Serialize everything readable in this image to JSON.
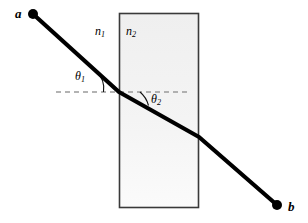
{
  "figure": {
    "background_color": "#ffffff",
    "canvas": {
      "width": 308,
      "height": 223
    }
  },
  "slab": {
    "name": "refracting-medium-slab",
    "x": 119,
    "y": 13,
    "width": 80,
    "height": 195,
    "border_color": "#3a3a3a",
    "fill_top_color": "#efefef",
    "fill_bottom_color": "#fbfbfb"
  },
  "ray": {
    "color": "#000000",
    "stroke_width": 4,
    "segments": [
      {
        "name": "incident-ray",
        "x1": 33,
        "y1": 14,
        "x2": 119,
        "y2": 92
      },
      {
        "name": "refracted-ray-inside",
        "x1": 119,
        "y1": 92,
        "x2": 199,
        "y2": 137
      },
      {
        "name": "emergent-ray",
        "x1": 199,
        "y1": 137,
        "x2": 277,
        "y2": 205
      }
    ],
    "endpoints": [
      {
        "name": "point-a-marker",
        "cx": 33,
        "cy": 14,
        "r": 5
      },
      {
        "name": "point-b-marker",
        "cx": 277,
        "cy": 205,
        "r": 5
      }
    ]
  },
  "normal_line": {
    "name": "horizontal-dashed-reference-line",
    "x1": 56,
    "y1": 92,
    "x2": 190,
    "y2": 92,
    "color": "#9a9a9a",
    "dash": "5,4",
    "stroke_width": 1.4
  },
  "angle_arcs": [
    {
      "name": "theta1-arc",
      "path": "M 97 73 A 22 22 0 0 1 103 92",
      "color": "#000000"
    },
    {
      "name": "theta2-arc",
      "path": "M 141 92 A 24 24 0 0 1 148 104",
      "color": "#000000"
    }
  ],
  "labels": {
    "point_a": "a",
    "point_b": "b",
    "index_n1_base": "n",
    "index_n1_sub": "1",
    "index_n2_base": "n",
    "index_n2_sub": "2",
    "theta1_base": "θ",
    "theta1_sub": "1",
    "theta2_base": "θ",
    "theta2_sub": "2"
  }
}
